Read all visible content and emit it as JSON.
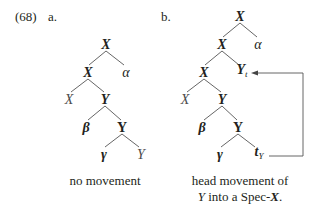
{
  "example": {
    "number": "(68)",
    "part_a_label": "a.",
    "part_b_label": "b."
  },
  "tree_a": {
    "nodes": {
      "root": "X",
      "x_bar": "X",
      "alpha": "α",
      "x_head": "X",
      "yp": "Y",
      "beta": "β",
      "y_bar": "Y",
      "gamma": "γ",
      "y_head": "Y"
    },
    "caption": "no movement"
  },
  "tree_b": {
    "nodes": {
      "root": "X",
      "x_bar1": "X",
      "alpha": "α",
      "x_bar2": "X",
      "y_moved": "Y",
      "y_moved_sub": "t",
      "x_head": "X",
      "yp": "Y",
      "beta": "β",
      "y_bar": "Y",
      "gamma": "γ",
      "trace": "t",
      "trace_sub": "Y"
    },
    "caption_line1": "head movement of",
    "caption_line2_pre": "Y",
    "caption_line2_mid": " into a Spec-",
    "caption_line2_bold": "X",
    "caption_line2_end": "."
  },
  "colors": {
    "text": "#231f20",
    "lines": "#555555",
    "plain_node": "#4a4a4a"
  }
}
